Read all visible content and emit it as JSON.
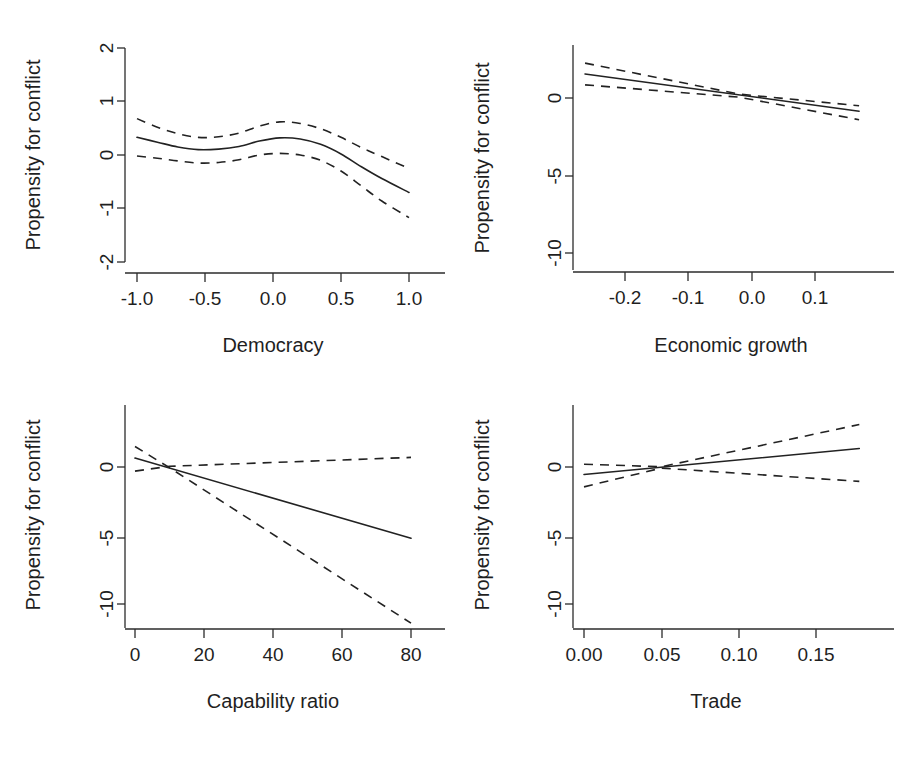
{
  "figure": {
    "layout": "2x2-grid",
    "background_color": "#ffffff",
    "line_color": "#222222",
    "shared_ylabel": "Propensity for conflict"
  },
  "chart_data": [
    {
      "id": "democracy",
      "type": "line",
      "title": "",
      "xlabel": "Democracy",
      "ylabel": "Propensity for conflict",
      "xlim": [
        -1.13,
        1.13
      ],
      "ylim": [
        -2.18,
        2.18
      ],
      "xticks": [
        -1.0,
        -0.5,
        0.0,
        0.5,
        1.0
      ],
      "xticklabels": [
        "-1.0",
        "-0.5",
        "0.0",
        "0.5",
        "1.0"
      ],
      "yticks": [
        2,
        1,
        0,
        -1,
        -2
      ],
      "yticklabels": [
        "2",
        "1",
        "0",
        "-1",
        "-2"
      ],
      "grid": false,
      "legend": "none",
      "series": [
        {
          "name": "fit",
          "style": "solid",
          "x": [
            -1.0,
            -0.85,
            -0.7,
            -0.55,
            -0.4,
            -0.25,
            -0.1,
            0.05,
            0.2,
            0.35,
            0.5,
            0.65,
            0.8,
            1.0
          ],
          "values": [
            0.33,
            0.24,
            0.15,
            0.1,
            0.11,
            0.16,
            0.26,
            0.32,
            0.3,
            0.2,
            0.02,
            -0.22,
            -0.44,
            -0.7
          ]
        },
        {
          "name": "upper-ci",
          "style": "dashed",
          "x": [
            -1.0,
            -0.85,
            -0.7,
            -0.55,
            -0.4,
            -0.25,
            -0.1,
            0.05,
            0.2,
            0.35,
            0.5,
            0.65,
            0.8,
            1.0
          ],
          "values": [
            0.68,
            0.52,
            0.4,
            0.33,
            0.34,
            0.41,
            0.54,
            0.62,
            0.59,
            0.49,
            0.33,
            0.14,
            -0.03,
            -0.25
          ]
        },
        {
          "name": "lower-ci",
          "style": "dashed",
          "x": [
            -1.0,
            -0.85,
            -0.7,
            -0.55,
            -0.4,
            -0.25,
            -0.1,
            0.05,
            0.2,
            0.35,
            0.5,
            0.65,
            0.8,
            1.0
          ],
          "values": [
            -0.02,
            -0.06,
            -0.11,
            -0.15,
            -0.14,
            -0.09,
            0.0,
            0.03,
            0.0,
            -0.1,
            -0.3,
            -0.58,
            -0.86,
            -1.17
          ]
        }
      ]
    },
    {
      "id": "economic-growth",
      "type": "line",
      "title": "",
      "xlabel": "Economic growth",
      "ylabel": "Propensity for conflict",
      "xlim": [
        -0.265,
        0.17
      ],
      "ylim": [
        -12.2,
        2.7
      ],
      "xticks": [
        -0.2,
        -0.1,
        0.0,
        0.1
      ],
      "xticklabels": [
        "-0.2",
        "-0.1",
        "0.0",
        "0.1"
      ],
      "yticks": [
        0,
        -5,
        -10
      ],
      "yticklabels": [
        "0",
        "-5",
        "-10"
      ],
      "grid": false,
      "legend": "none",
      "series": [
        {
          "name": "fit",
          "style": "solid",
          "x": [
            -0.265,
            0.17
          ],
          "values": [
            1.55,
            -0.85
          ]
        },
        {
          "name": "upper-ci",
          "style": "dashed",
          "x": [
            -0.265,
            -0.02,
            0.17
          ],
          "values": [
            2.25,
            0.25,
            -0.5
          ]
        },
        {
          "name": "lower-ci",
          "style": "dashed",
          "x": [
            -0.265,
            -0.02,
            0.17
          ],
          "values": [
            0.85,
            0.05,
            -1.4
          ]
        }
      ]
    },
    {
      "id": "capability-ratio",
      "type": "line",
      "title": "",
      "xlabel": "Capability ratio",
      "ylabel": "Propensity for conflict",
      "xlim": [
        -2.5,
        82
      ],
      "ylim": [
        -12.2,
        2.7
      ],
      "xticks": [
        0,
        20,
        40,
        60,
        80
      ],
      "xticklabels": [
        "0",
        "20",
        "40",
        "60",
        "80"
      ],
      "yticks": [
        0,
        -5,
        -10
      ],
      "yticklabels": [
        "0",
        "-5",
        "-10"
      ],
      "grid": false,
      "legend": "none",
      "series": [
        {
          "name": "fit",
          "style": "solid",
          "x": [
            0,
            80
          ],
          "values": [
            0.65,
            -5.2
          ]
        },
        {
          "name": "upper-ci",
          "style": "dashed",
          "x": [
            0,
            10,
            80
          ],
          "values": [
            -0.3,
            0.05,
            0.7
          ]
        },
        {
          "name": "lower-ci",
          "style": "dashed",
          "x": [
            0,
            10,
            80
          ],
          "values": [
            1.5,
            -0.05,
            -11.4
          ]
        }
      ]
    },
    {
      "id": "trade",
      "type": "line",
      "title": "",
      "xlabel": "Trade",
      "ylabel": "Propensity for conflict",
      "xlim": [
        -0.004,
        0.178
      ],
      "ylim": [
        -12.2,
        2.7
      ],
      "xticks": [
        0.0,
        0.05,
        0.1,
        0.15
      ],
      "xticklabels": [
        "0.00",
        "0.05",
        "0.10",
        "0.15"
      ],
      "yticks": [
        0,
        -5,
        -10
      ],
      "yticklabels": [
        "0",
        "-5",
        "-10"
      ],
      "grid": false,
      "legend": "none",
      "series": [
        {
          "name": "fit",
          "style": "solid",
          "x": [
            0.0,
            0.178
          ],
          "values": [
            -0.55,
            1.35
          ]
        },
        {
          "name": "upper-ci",
          "style": "dashed",
          "x": [
            0.0,
            0.05,
            0.178
          ],
          "values": [
            0.2,
            0.02,
            3.1
          ]
        },
        {
          "name": "lower-ci",
          "style": "dashed",
          "x": [
            0.0,
            0.05,
            0.178
          ],
          "values": [
            -1.45,
            -0.08,
            -1.05
          ]
        }
      ]
    }
  ]
}
